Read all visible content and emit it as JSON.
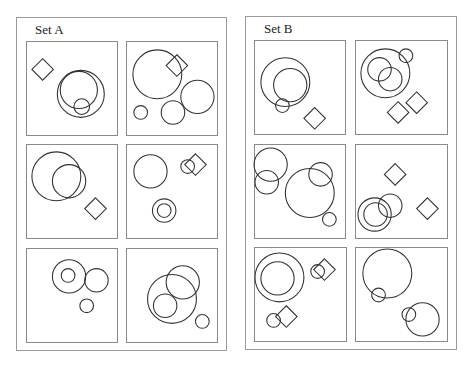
{
  "sets": [
    {
      "title": "Set A",
      "box": {
        "x": 16,
        "y": 17,
        "w": 211,
        "h": 334
      },
      "title_pos": {
        "x": 35,
        "y": 22
      },
      "cells": [
        {
          "box": {
            "x": 26,
            "y": 41,
            "w": 92,
            "h": 95
          },
          "circles": [
            [
              55,
              53,
              24
            ],
            [
              53,
              49,
              19
            ],
            [
              56,
              66,
              8
            ]
          ],
          "diamonds": [
            [
              16,
              28,
              11
            ]
          ]
        },
        {
          "box": {
            "x": 126,
            "y": 41,
            "w": 92,
            "h": 95
          },
          "circles": [
            [
              31,
              33,
              25
            ],
            [
              72,
              56,
              17
            ],
            [
              47,
              72,
              12
            ],
            [
              14,
              72,
              7
            ]
          ],
          "diamonds": [
            [
              51,
              24,
              11
            ]
          ]
        },
        {
          "box": {
            "x": 26,
            "y": 144,
            "w": 92,
            "h": 95
          },
          "circles": [
            [
              30,
              32,
              25
            ],
            [
              43,
              37,
              17
            ]
          ],
          "diamonds": [
            [
              70,
              65,
              11
            ]
          ]
        },
        {
          "box": {
            "x": 126,
            "y": 144,
            "w": 92,
            "h": 95
          },
          "circles": [
            [
              24,
              27,
              17
            ],
            [
              62,
              22,
              7
            ],
            [
              38,
              67,
              12
            ],
            [
              38,
              67,
              7
            ]
          ],
          "diamonds": [
            [
              70,
              20,
              11
            ]
          ]
        },
        {
          "box": {
            "x": 26,
            "y": 248,
            "w": 92,
            "h": 95
          },
          "circles": [
            [
              43,
              28,
              17
            ],
            [
              42,
              27,
              7
            ],
            [
              71,
              32,
              12
            ],
            [
              61,
              58,
              7
            ]
          ],
          "diamonds": []
        },
        {
          "box": {
            "x": 126,
            "y": 248,
            "w": 92,
            "h": 95
          },
          "circles": [
            [
              46,
              51,
              25
            ],
            [
              57,
              34,
              17
            ],
            [
              39,
              58,
              12
            ],
            [
              77,
              74,
              7
            ]
          ],
          "diamonds": []
        }
      ]
    },
    {
      "title": "Set B",
      "box": {
        "x": 245,
        "y": 16,
        "w": 212,
        "h": 334
      },
      "title_pos": {
        "x": 264,
        "y": 21
      },
      "cells": [
        {
          "box": {
            "x": 254,
            "y": 40,
            "w": 92,
            "h": 95
          },
          "circles": [
            [
              31,
              42,
              25
            ],
            [
              36,
              45,
              17
            ],
            [
              28,
              66,
              7
            ]
          ],
          "diamonds": [
            [
              61,
              79,
              11
            ]
          ]
        },
        {
          "box": {
            "x": 355,
            "y": 40,
            "w": 93,
            "h": 95
          },
          "circles": [
            [
              30,
              33,
              25
            ],
            [
              24,
              29,
              12
            ],
            [
              35,
              39,
              12
            ],
            [
              51,
              15,
              7
            ]
          ],
          "diamonds": [
            [
              43,
              73,
              11
            ],
            [
              62,
              63,
              11
            ]
          ]
        },
        {
          "box": {
            "x": 254,
            "y": 144,
            "w": 92,
            "h": 95
          },
          "circles": [
            [
              16,
              20,
              17
            ],
            [
              12,
              38,
              12
            ],
            [
              56,
              49,
              25
            ],
            [
              67,
              30,
              12
            ],
            [
              76,
              76,
              7
            ]
          ],
          "diamonds": []
        },
        {
          "box": {
            "x": 355,
            "y": 144,
            "w": 93,
            "h": 95
          },
          "circles": [
            [
              19,
              71,
              17
            ],
            [
              20,
              71,
              12
            ],
            [
              35,
              62,
              12
            ]
          ],
          "diamonds": [
            [
              40,
              30,
              11
            ],
            [
              73,
              65,
              11
            ]
          ]
        },
        {
          "box": {
            "x": 254,
            "y": 247,
            "w": 93,
            "h": 95
          },
          "circles": [
            [
              25,
              30,
              25
            ],
            [
              23,
              31,
              17
            ],
            [
              64,
              24,
              7
            ],
            [
              19,
              74,
              7
            ]
          ],
          "diamonds": [
            [
              71,
              22,
              11
            ],
            [
              32,
              70,
              11
            ]
          ]
        },
        {
          "box": {
            "x": 355,
            "y": 247,
            "w": 93,
            "h": 95
          },
          "circles": [
            [
              32,
              26,
              25
            ],
            [
              23,
              48,
              7
            ],
            [
              68,
              73,
              17
            ],
            [
              54,
              68,
              7
            ]
          ],
          "diamonds": []
        }
      ]
    }
  ]
}
